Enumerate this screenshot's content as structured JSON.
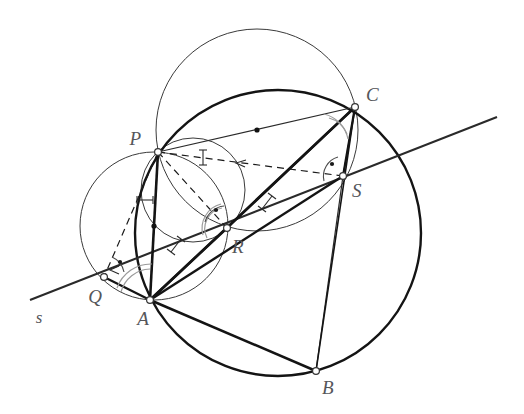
{
  "figure": {
    "background_color": "#ffffff",
    "stroke_color_main": "#1a1a1a",
    "stroke_color_thin": "#3a3a3a",
    "stroke_color_arc": "#8c8c8c",
    "label_color": "#55565a",
    "width": 524,
    "height": 414
  },
  "labels": {
    "P": "P",
    "Q": "Q",
    "R": "R",
    "S": "S",
    "A": "A",
    "B": "B",
    "C": "C",
    "s": "s"
  },
  "points": {
    "P": {
      "name": "P",
      "x": 158,
      "y": 152,
      "label_x": 141,
      "label_y": 145
    },
    "Q": {
      "name": "Q",
      "x": 104,
      "y": 277,
      "label_x": 95,
      "label_y": 303
    },
    "R": {
      "name": "R",
      "x": 227,
      "y": 228,
      "label_x": 232,
      "label_y": 253
    },
    "S": {
      "name": "S",
      "x": 343,
      "y": 176,
      "label_x": 352,
      "label_y": 197
    },
    "A": {
      "name": "A",
      "x": 150,
      "y": 300,
      "label_x": 143,
      "label_y": 325
    },
    "B": {
      "name": "B",
      "x": 316,
      "y": 371,
      "label_x": 322,
      "label_y": 394
    },
    "C": {
      "name": "C",
      "x": 355,
      "y": 107,
      "label_x": 366,
      "label_y": 101
    }
  },
  "line_s": {
    "name": "Simson line s",
    "x1": 30,
    "y1": 300,
    "x2": 497,
    "y2": 117,
    "label": "s",
    "label_x": 39,
    "label_y": 323
  },
  "circles": {
    "circumcircle": {
      "name": "circumcircle-ABC",
      "cx": 278,
      "cy": 233,
      "r": 143,
      "weight": "thick"
    },
    "circle_PC": {
      "name": "circle-diameter-PC",
      "cx": 257,
      "cy": 130,
      "r": 101,
      "weight": "thin",
      "center_dot": true
    },
    "circle_PA": {
      "name": "circle-diameter-PA",
      "cx": 154,
      "cy": 226,
      "r": 74,
      "weight": "thin",
      "center_dot": true
    },
    "circle_PR": {
      "name": "circle-diameter-PR",
      "cx": 193,
      "cy": 190,
      "r": 52,
      "weight": "thin",
      "center_dot": true
    }
  },
  "segments": [
    {
      "name": "side-AB",
      "from": "A",
      "to": "B",
      "weight": "thick",
      "style": "solid"
    },
    {
      "name": "side-BC",
      "from": "B",
      "to": "C",
      "weight": "thick",
      "style": "solid"
    },
    {
      "name": "side-CA",
      "from": "C",
      "to": "A",
      "weight": "thick",
      "style": "solid"
    },
    {
      "name": "chord-AP",
      "from": "A",
      "to": "P",
      "weight": "thick",
      "style": "solid"
    },
    {
      "name": "chord-PC",
      "from": "P",
      "to": "C",
      "weight": "thin",
      "style": "solid"
    },
    {
      "name": "chord-AR",
      "from": "A",
      "to": "R",
      "weight": "thick",
      "style": "solid"
    },
    {
      "name": "chord-RC",
      "from": "R",
      "to": "C",
      "weight": "thick",
      "style": "solid"
    },
    {
      "name": "chord-SB",
      "from": "S",
      "to": "B",
      "weight": "thin",
      "style": "solid"
    },
    {
      "name": "chord-SC",
      "from": "S",
      "to": "C",
      "weight": "thick",
      "style": "solid"
    },
    {
      "name": "perp-PS",
      "from": "P",
      "to": "S",
      "weight": "thin",
      "style": "dashed"
    },
    {
      "name": "perp-PR",
      "from": "P",
      "to": "R",
      "weight": "thin",
      "style": "dashed"
    },
    {
      "name": "perp-PQ",
      "from": "P",
      "to": "Q",
      "weight": "thin",
      "style": "dashed"
    },
    {
      "name": "ray-QA",
      "from": "Q",
      "to": "A",
      "weight": "thick",
      "style": "solid"
    },
    {
      "name": "ray-AS",
      "from": "A",
      "to": "S",
      "weight": "thick",
      "style": "solid"
    }
  ],
  "marks": {
    "right_angles": [
      {
        "name": "right-angle-at-Q",
        "vertex": "Q"
      },
      {
        "name": "right-angle-at-R",
        "vertex": "R"
      },
      {
        "name": "right-angle-at-S",
        "vertex": "S"
      }
    ],
    "equal_angle_arcs": [
      {
        "name": "angle-arc-at-A",
        "vertex": "A"
      },
      {
        "name": "angle-arc-at-C",
        "vertex": "C"
      },
      {
        "name": "angle-arc-at-R-upper",
        "vertex": "R"
      },
      {
        "name": "angle-arc-at-R-lower",
        "vertex": "R"
      }
    ],
    "tick_marks": [
      {
        "name": "tick-on-PS"
      },
      {
        "name": "tick-on-PA"
      },
      {
        "name": "tick-on-RS"
      },
      {
        "name": "tick-on-QR"
      }
    ]
  }
}
